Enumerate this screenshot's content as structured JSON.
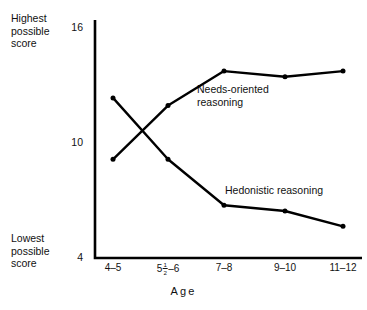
{
  "chart_data": {
    "type": "line",
    "title": "",
    "xlabel": "Age",
    "ylabel": "",
    "categories": [
      "4–5",
      "5½–6",
      "7–8",
      "9–10",
      "11–12"
    ],
    "series": [
      {
        "name": "Needs-oriented reasoning",
        "label_text": "Needs-oriented\nreasoning",
        "values": [
          9.1,
          11.9,
          13.7,
          13.4,
          13.7
        ],
        "color": "#000000"
      },
      {
        "name": "Hedonistic reasoning",
        "label_text": "Hedonistic reasoning",
        "values": [
          12.3,
          9.1,
          6.7,
          6.4,
          5.6
        ],
        "color": "#000000"
      }
    ],
    "ylim": [
      4,
      16
    ],
    "ytick_values": [
      16,
      10,
      4
    ],
    "ytick_labels": [
      "16",
      "10",
      "4"
    ],
    "grid": false,
    "legend": "inline-annotations",
    "y_axis_top_annotation": "Highest\npossible\nscore",
    "y_axis_bottom_annotation": "Lowest\npossible\nscore"
  },
  "axis": {
    "line_color": "#000000"
  }
}
